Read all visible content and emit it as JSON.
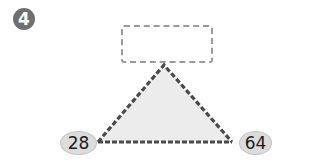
{
  "problem": {
    "number": "4",
    "answer_box": {
      "value": ""
    },
    "triangle": {
      "fill": "#ececec",
      "stroke": "#4a4a4a"
    },
    "left_value": "28",
    "right_value": "64"
  }
}
